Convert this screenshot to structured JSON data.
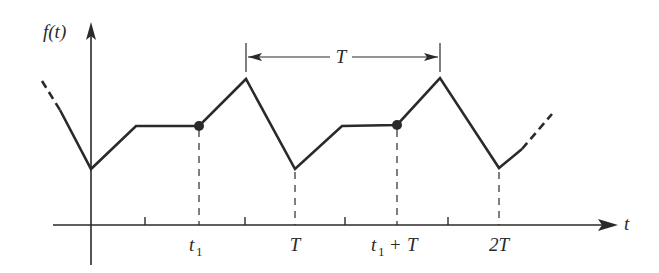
{
  "figure": {
    "y_axis_label": "f(t)",
    "x_axis_label": "t",
    "period_label": "T",
    "tick_labels": [
      {
        "text": "t",
        "sub": "1",
        "x": 199
      },
      {
        "text": "T",
        "sub": "",
        "x": 295
      },
      {
        "text": "t",
        "sub": "1",
        "suffix": " + T",
        "x": 397
      },
      {
        "text": "2T",
        "sub": "",
        "x": 499
      }
    ],
    "tick_label_strings": [
      "t1",
      "T",
      "t1 + T",
      "2T"
    ]
  },
  "colors": {
    "line": "#2a2a2a",
    "background": "#ffffff"
  }
}
